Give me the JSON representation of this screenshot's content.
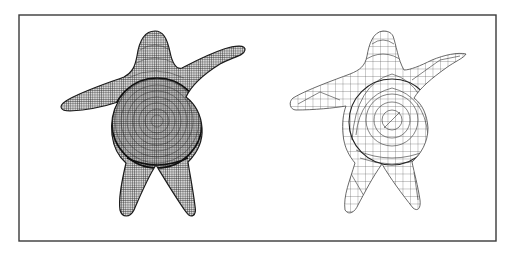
{
  "figure": {
    "frame": {
      "x": 19,
      "y": 15,
      "width": 477,
      "height": 226,
      "stroke": "#3a3a3a"
    },
    "panels": [
      {
        "id": "dense-mesh",
        "label": "",
        "mesh_density": "fine",
        "line_color": "#1c1c1c"
      },
      {
        "id": "coarse-mesh",
        "label": "",
        "mesh_density": "coarse",
        "line_color": "#444444"
      }
    ]
  }
}
